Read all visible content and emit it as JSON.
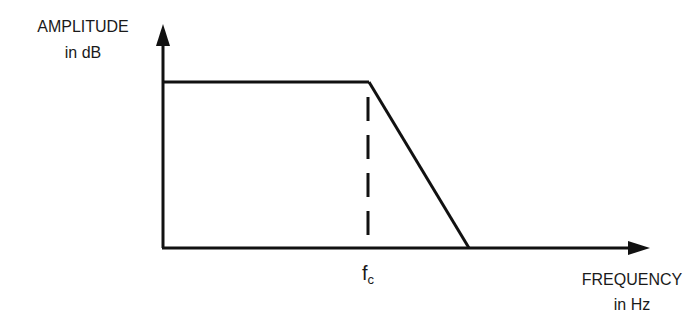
{
  "diagram": {
    "type": "low-pass filter frequency response (Bode magnitude, idealized)",
    "y_axis": {
      "label_line1": "AMPLITUDE",
      "label_line2": "in dB"
    },
    "x_axis": {
      "label_line1": "FREQUENCY",
      "label_line2": "in Hz"
    },
    "cutoff": {
      "label_main": "f",
      "label_sub": "c"
    },
    "colors": {
      "line": "#111111",
      "text": "#1a1a1a",
      "background": "#ffffff"
    }
  }
}
